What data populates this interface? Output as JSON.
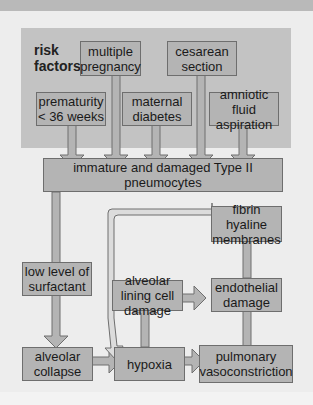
{
  "diagram": {
    "title": "risk factors",
    "risk_factors": [
      {
        "id": "multiple-pregnancy",
        "label": "multiple pregnancy"
      },
      {
        "id": "cesarean-section",
        "label": "cesarean section"
      },
      {
        "id": "prematurity",
        "label": "prematurity < 36 weeks"
      },
      {
        "id": "maternal-diabetes",
        "label": "maternal diabetes"
      },
      {
        "id": "amniotic-fluid-aspiration",
        "label": "amniotic fluid aspiration"
      }
    ],
    "nodes": {
      "pneumocytes": "immature and damaged Type II pneumocytes",
      "surfactant": "low level of surfactant",
      "collapse": "alveolar collapse",
      "hypoxia": "hypoxia",
      "lining_damage": "alveolar lining cell damage",
      "endothelial": "endothelial damage",
      "vasoconstriction": "pulmonary vasoconstriction",
      "fibrin": "fibrin hyaline membranes"
    },
    "edges": [
      [
        "prematurity",
        "pneumocytes"
      ],
      [
        "multiple-pregnancy",
        "pneumocytes"
      ],
      [
        "maternal-diabetes",
        "pneumocytes"
      ],
      [
        "cesarean-section",
        "pneumocytes"
      ],
      [
        "amniotic-fluid-aspiration",
        "pneumocytes"
      ],
      [
        "pneumocytes",
        "surfactant"
      ],
      [
        "surfactant",
        "collapse"
      ],
      [
        "collapse",
        "hypoxia"
      ],
      [
        "hypoxia",
        "lining_damage"
      ],
      [
        "hypoxia",
        "vasoconstriction"
      ],
      [
        "lining_damage",
        "endothelial"
      ],
      [
        "vasoconstriction",
        "endothelial"
      ],
      [
        "endothelial",
        "fibrin"
      ],
      [
        "fibrin",
        "hypoxia"
      ]
    ],
    "colors": {
      "background": "#ededed",
      "panel": "#c3c3c3",
      "box": "#b4b4b4",
      "arrow_fill": "#b4b4b4",
      "feedback_arrow_fill": "#dcdcdc",
      "stroke": "#6e6e6e"
    }
  }
}
